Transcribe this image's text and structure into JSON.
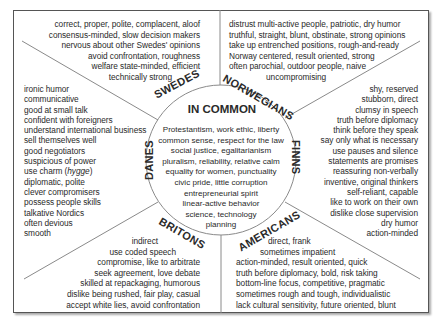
{
  "title": "IN COMMON",
  "common": [
    "Protestantism, work ethic, liberty",
    "common sense, respect for the law",
    "social justice, egalitarianism",
    "pluralism, reliability, relative calm",
    "equality for women, punctuality",
    "civic pride, little corruption",
    "entrepreneurial spirit",
    "linear-active behavior",
    "science, technology",
    "planning"
  ],
  "groups": {
    "swedes": {
      "label": "SWEDES",
      "traits": [
        "correct, proper, polite, complacent, aloof",
        "consensus-minded, slow decision makers",
        "nervous about other Swedes' opinions",
        "avoid confrontation, roughness",
        "welfare state-minded, efficient",
        "technically strong"
      ]
    },
    "norwegians": {
      "label": "NORWEGIANS",
      "traits": [
        "distrust multi-active people, patriotic, dry humor",
        "truthful, straight, blunt, obstinate, strong opinions",
        "take up entrenched positions, rough-and-ready",
        "Norway centered, result oriented, strong",
        "often parochial, outdoor people, naive",
        "uncompromising"
      ]
    },
    "danes": {
      "label": "DANES",
      "traits": [
        "ironic humor",
        "communicative",
        "good at small talk",
        "confident with foreigners",
        "understand international business",
        "sell themselves well",
        "good negotiators",
        "suspicious of power",
        "use charm (hygge)",
        "diplomatic, polite",
        "clever compromisers",
        "possess people skills",
        "talkative Nordics",
        "often devious",
        "smooth"
      ]
    },
    "finns": {
      "label": "FINNS",
      "traits": [
        "shy, reserved",
        "stubborn, direct",
        "clumsy in speech",
        "truth before diplomacy",
        "think before they speak",
        "say only what is necessary",
        "use pauses and silence",
        "statements are promises",
        "reassuring non-verbally",
        "inventive, original thinkers",
        "self-reliant, capable",
        "like to work on their own",
        "dislike close supervision",
        "dry humor",
        "action-minded"
      ]
    },
    "britons": {
      "label": "BRITONS",
      "traits": [
        "indirect",
        "use coded speech",
        "compromise, like to arbitrate",
        "seek agreement, love debate",
        "skilled at repackaging, humorous",
        "dislike being rushed, fair play, casual",
        "accept white lies, avoid confrontation"
      ]
    },
    "americans": {
      "label": "AMERICANS",
      "traits": [
        "direct, frank",
        "sometimes impatient",
        "action-minded, result oriented, quick",
        "truth before diplomacy, bold, risk taking",
        "bottom-line focus, competitive, pragmatic",
        "sometimes rough and tough, individualistic",
        "lack cultural sensitivity, future oriented, blunt"
      ]
    }
  },
  "colors": {
    "frame": "#555555",
    "lines": "#8a8a8a",
    "text": "#2a2a2a"
  }
}
